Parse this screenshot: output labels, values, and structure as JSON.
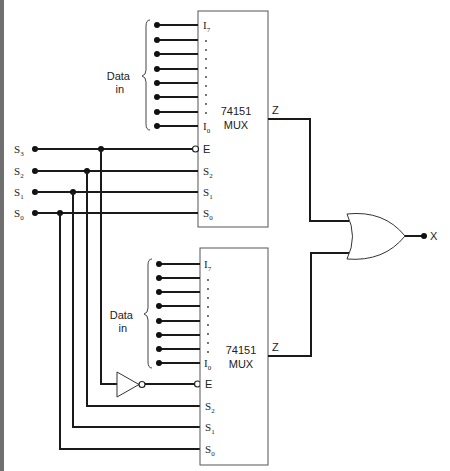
{
  "diagram": {
    "type": "logic-circuit",
    "title": "",
    "select_inputs": [
      {
        "name": "S",
        "sub": "3"
      },
      {
        "name": "S",
        "sub": "2"
      },
      {
        "name": "S",
        "sub": "1"
      },
      {
        "name": "S",
        "sub": "0"
      }
    ],
    "muxes": [
      {
        "id": "top",
        "chip": "74151",
        "type": "MUX",
        "data_label_line1": "Data",
        "data_label_line2": "in",
        "pin_top": {
          "name": "I",
          "sub": "7"
        },
        "pin_bottom": {
          "name": "I",
          "sub": "0"
        },
        "enable": "E",
        "selects": [
          {
            "name": "S",
            "sub": "2"
          },
          {
            "name": "S",
            "sub": "1"
          },
          {
            "name": "S",
            "sub": "0"
          }
        ],
        "output": "Z"
      },
      {
        "id": "bottom",
        "chip": "74151",
        "type": "MUX",
        "data_label_line1": "Data",
        "data_label_line2": "in",
        "pin_top": {
          "name": "I",
          "sub": "7"
        },
        "pin_bottom": {
          "name": "I",
          "sub": "0"
        },
        "enable": "E",
        "selects": [
          {
            "name": "S",
            "sub": "2"
          },
          {
            "name": "S",
            "sub": "1"
          },
          {
            "name": "S",
            "sub": "0"
          }
        ],
        "output": "Z"
      }
    ],
    "gate": "OR",
    "inverter": "NOT",
    "output": "X",
    "colors": {
      "line": "#1a1a1a",
      "edge_bar": "#6f6f6f",
      "background": "#ffffff"
    }
  }
}
